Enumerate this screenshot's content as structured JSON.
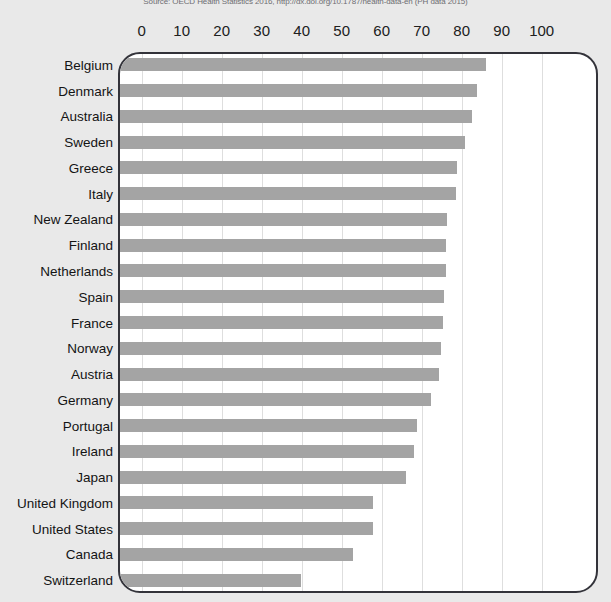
{
  "caption": {
    "text": "Source: OECD Health Statistics 2016, http://dx.doi.org/10.1787/health-data-en (PH data 2015)"
  },
  "chart_data": {
    "type": "bar",
    "orientation": "horizontal",
    "title": "",
    "xlabel": "",
    "ylabel": "",
    "xlim": [
      0,
      105
    ],
    "xticks": [
      0,
      10,
      20,
      30,
      40,
      50,
      60,
      70,
      80,
      90,
      100
    ],
    "grid": true,
    "legend": "none",
    "bar_color": "#a4a4a4",
    "background_color": "#e9e9e9",
    "plot_background_color": "#ffffff",
    "categories": [
      "Belgium",
      "Denmark",
      "Australia",
      "Sweden",
      "Greece",
      "Italy",
      "New Zealand",
      "Finland",
      "Netherlands",
      "Spain",
      "France",
      "Norway",
      "Austria",
      "Germany",
      "Portugal",
      "Ireland",
      "Japan",
      "United Kingdom",
      "United States",
      "Canada",
      "Switzerland"
    ],
    "values": [
      86.1,
      83.7,
      82.5,
      80.8,
      78.9,
      78.6,
      76.3,
      76.1,
      76.0,
      75.6,
      75.2,
      74.8,
      74.4,
      72.3,
      68.9,
      68.1,
      66.1,
      57.7,
      57.7,
      52.7,
      39.8
    ]
  }
}
